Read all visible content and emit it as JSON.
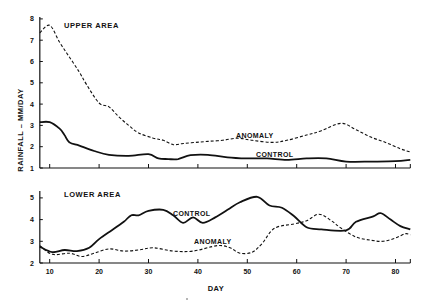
{
  "chart_data": [
    {
      "type": "line",
      "panel": "upper",
      "title": "UPPER AREA",
      "xlabel": "DAY",
      "ylabel": "RAINFALL – MM/DAY",
      "xlim": [
        8,
        83
      ],
      "ylim": [
        1,
        8
      ],
      "yticks": [
        1,
        2,
        3,
        4,
        5,
        6,
        7,
        8
      ],
      "xticks": [
        10,
        20,
        30,
        40,
        50,
        60,
        70,
        80
      ],
      "grid": false,
      "series": [
        {
          "name": "ANOMALY",
          "style": "dashed",
          "x": [
            8,
            10,
            12,
            14,
            16,
            17.5,
            20,
            22,
            24,
            26,
            28,
            31,
            33,
            35,
            37,
            39.5,
            42,
            45,
            48,
            51,
            55,
            58,
            62,
            65,
            69,
            72,
            75,
            78,
            81,
            83
          ],
          "y": [
            7.35,
            7.7,
            6.9,
            6.2,
            5.5,
            4.9,
            4.05,
            3.87,
            3.4,
            3.0,
            2.65,
            2.4,
            2.3,
            2.1,
            2.15,
            2.2,
            2.25,
            2.3,
            2.4,
            2.3,
            2.2,
            2.3,
            2.55,
            2.75,
            3.1,
            2.8,
            2.45,
            2.2,
            1.9,
            1.75
          ]
        },
        {
          "name": "CONTROL",
          "style": "solid",
          "x": [
            8,
            10,
            12,
            13,
            14,
            16,
            19,
            22,
            26,
            30,
            32,
            34,
            36,
            38.5,
            42,
            46,
            50,
            54,
            58,
            62,
            66,
            70,
            75,
            80,
            83
          ],
          "y": [
            3.15,
            3.15,
            2.85,
            2.55,
            2.2,
            2.05,
            1.8,
            1.62,
            1.57,
            1.65,
            1.45,
            1.42,
            1.42,
            1.6,
            1.62,
            1.5,
            1.45,
            1.45,
            1.38,
            1.45,
            1.45,
            1.3,
            1.3,
            1.32,
            1.38
          ]
        }
      ],
      "annotations": [
        {
          "text": "ANOMALY",
          "x": 64,
          "y": 2.55
        },
        {
          "text": "CONTROL",
          "x": 67,
          "y": 1.6
        }
      ]
    },
    {
      "type": "line",
      "panel": "lower",
      "title": "LOWER AREA",
      "xlabel": "DAY",
      "ylabel": "RAINFALL – MM/DAY",
      "xlim": [
        8,
        83
      ],
      "ylim": [
        2,
        5.3
      ],
      "yticks": [
        2,
        3,
        4,
        5
      ],
      "xticks": [
        10,
        20,
        30,
        40,
        50,
        60,
        70,
        80
      ],
      "grid": false,
      "series": [
        {
          "name": "CONTROL",
          "style": "solid",
          "x": [
            8,
            10.5,
            13,
            15.5,
            18,
            20,
            22.5,
            25,
            26.5,
            28,
            30,
            33,
            35,
            37,
            39,
            41,
            43.5,
            46,
            48.5,
            52,
            54.5,
            57,
            59.5,
            62,
            65,
            70,
            72,
            75.5,
            77,
            79,
            81,
            83
          ],
          "y": [
            2.75,
            2.5,
            2.6,
            2.55,
            2.7,
            3.1,
            3.5,
            3.9,
            4.2,
            4.2,
            4.4,
            4.45,
            4.2,
            3.85,
            4.1,
            3.85,
            4.1,
            4.45,
            4.8,
            5.05,
            4.65,
            4.55,
            4.15,
            3.65,
            3.55,
            3.5,
            3.9,
            4.15,
            4.3,
            4.0,
            3.7,
            3.55
          ]
        },
        {
          "name": "ANOMALY",
          "style": "dashed",
          "x": [
            8,
            10.5,
            14,
            16.5,
            19,
            22,
            25,
            28,
            31,
            35,
            39,
            44,
            46.5,
            48.5,
            51,
            53,
            55.5,
            59.5,
            62,
            64.5,
            67,
            69,
            72,
            75,
            77.5,
            80,
            82,
            83
          ],
          "y": [
            2.8,
            2.4,
            2.45,
            2.3,
            2.45,
            2.65,
            2.55,
            2.6,
            2.7,
            2.55,
            2.55,
            2.8,
            2.7,
            2.45,
            2.5,
            2.9,
            3.6,
            3.8,
            3.95,
            4.25,
            3.95,
            3.6,
            3.2,
            3.05,
            3.0,
            3.15,
            3.35,
            3.3
          ]
        }
      ],
      "annotations": [
        {
          "text": "CONTROL",
          "x": 35.5,
          "y": 4.3
        },
        {
          "text": "ANOMALY",
          "x": 40,
          "y": 2.95
        }
      ]
    }
  ],
  "labels": {
    "upper_title": "UPPER AREA",
    "lower_title": "LOWER AREA",
    "upper_anomaly": "ANOMALY",
    "upper_control": "CONTROL",
    "lower_control": "CONTROL",
    "lower_anomaly": "ANOMALY",
    "xlabel": "DAY",
    "ylabel": "RAINFALL – MM/DAY"
  },
  "colors": {
    "ink": "#111111",
    "background": "#ffffff"
  }
}
